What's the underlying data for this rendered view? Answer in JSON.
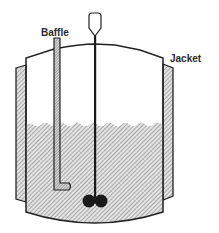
{
  "diagram": {
    "labels": {
      "baffle": "Baffle",
      "jacket": "Jacket"
    },
    "components": [
      {
        "name": "vessel",
        "description": "Cylindrical vessel with domed lid and curved bottom"
      },
      {
        "name": "jacket",
        "description": "Hatched heating/cooling jacket on left and right walls"
      },
      {
        "name": "baffle",
        "description": "Vertical L-shaped hatched baffle on the left"
      },
      {
        "name": "shaft",
        "description": "Central agitator shaft with drive handle on top"
      },
      {
        "name": "impeller",
        "description": "Two dark round impeller blades at bottom of shaft"
      },
      {
        "name": "liquid",
        "description": "Hatched liquid fill with wavy surface"
      }
    ],
    "colors": {
      "stroke": "#222222",
      "hatch": "#6a6a6a",
      "liquid_bg": "#e6e6e6",
      "impeller": "#1a1a1a",
      "background": "#ffffff"
    }
  }
}
